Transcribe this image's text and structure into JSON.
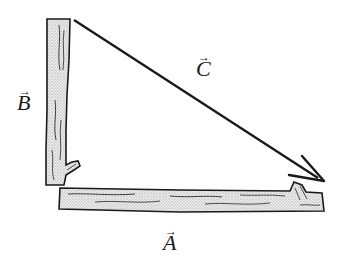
{
  "diagram": {
    "vectors": [
      {
        "id": "A",
        "label": "A",
        "description": "horizontal log along bottom",
        "direction": "right"
      },
      {
        "id": "B",
        "label": "B",
        "description": "vertical log on left side",
        "direction": "up"
      },
      {
        "id": "C",
        "label": "C",
        "description": "resultant arrow from top of B to end of A",
        "direction": "down-right"
      }
    ],
    "labels": {
      "A": "A",
      "B": "B",
      "C": "C",
      "vector_arrow": "→"
    },
    "colors": {
      "stroke": "#1a1a1a",
      "log_fill": "#d9d9d9",
      "background": "#ffffff"
    }
  }
}
